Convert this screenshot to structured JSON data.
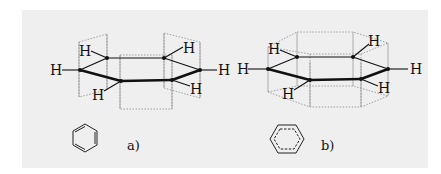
{
  "figure": {
    "panels": [
      {
        "id": "a",
        "caption": "a)",
        "description": "Kekulé structure of benzene with localized p-orbital overlap",
        "atom_label": "H",
        "hydrogens": [
          "H",
          "H",
          "H",
          "H",
          "H",
          "H"
        ],
        "icon": "benzene-kekule-icon"
      },
      {
        "id": "b",
        "caption": "b)",
        "description": "Benzene with delocalized pi electron cloud",
        "atom_label": "H",
        "hydrogens": [
          "H",
          "H",
          "H",
          "H",
          "H",
          "H"
        ],
        "icon": "benzene-delocalized-icon"
      }
    ],
    "colors": {
      "background": "#efefef",
      "bond": "#111111",
      "orbital_outline": "#8a8a8a"
    }
  }
}
